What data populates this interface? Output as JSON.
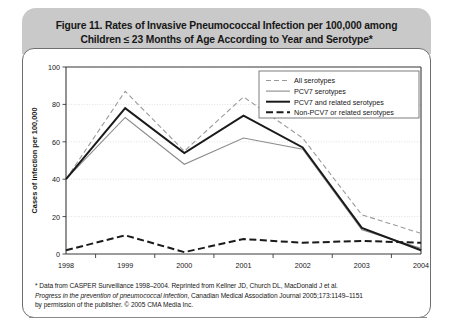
{
  "figure": {
    "title_line1": "Figure 11. Rates of Invasive Pneumococcal Infection per 100,000 among",
    "title_line2": "Children ≤ 23 Months of Age According to Year and Serotype*"
  },
  "footnote": {
    "line1": "* Data from CASPER Surveillance 1998–2004. Reprinted from Kellner JD, Church DL, MacDonald J et al.",
    "line2_italic": "Progress in the prevention of pneumococcal infection",
    "line2_rest": ", Canadian Medical Association Journal 2005;173:1149–1151",
    "line3": "by permission of the publisher. © 2005 CMA Media Inc."
  },
  "colors": {
    "header_band": "#c9c9c9",
    "panel_border": "#6f6f6f",
    "grid": "#d8d8d8",
    "axis": "#3a3a3a",
    "all_serotypes": "#9a9a9a",
    "pcv7_serotypes": "#8c8c8c",
    "pcv7_and_related": "#1a1a1a",
    "non_pcv7": "#1a1a1a"
  },
  "chart_data": {
    "type": "line",
    "title": "Rates of Invasive Pneumococcal Infection per 100,000 among Children ≤ 23 Months of Age According to Year and Serotype",
    "xlabel": "",
    "ylabel": "Cases of infection per 100,000",
    "categories": [
      "1998",
      "1999",
      "2000",
      "2001",
      "2002",
      "2003",
      "2004"
    ],
    "x_tick_labels": [
      "1998",
      "1999",
      "2000",
      "2001",
      "2002",
      "2003",
      "2004"
    ],
    "y_tick_labels": [
      "0",
      "20",
      "40",
      "60",
      "80",
      "100"
    ],
    "y_ticks": [
      0,
      20,
      40,
      60,
      80,
      100
    ],
    "ylim": [
      0,
      100
    ],
    "grid": true,
    "legend_position": "top-right",
    "series": [
      {
        "name": "All serotypes",
        "style": "dashed",
        "width": "thin",
        "color": "#9a9a9a",
        "values": [
          40,
          87,
          55,
          84,
          62,
          21,
          11
        ]
      },
      {
        "name": "PCV7 serotypes",
        "style": "solid",
        "width": "thin",
        "color": "#8c8c8c",
        "values": [
          40,
          73,
          48,
          62,
          56,
          13,
          3
        ]
      },
      {
        "name": "PCV7 and related serotypes",
        "style": "solid",
        "width": "thick",
        "color": "#1a1a1a",
        "values": [
          40,
          78,
          54,
          74,
          57,
          14,
          2
        ]
      },
      {
        "name": "Non-PCV7 or related serotypes",
        "style": "dashed",
        "width": "thick",
        "color": "#1a1a1a",
        "values": [
          2,
          10,
          1,
          8,
          6,
          7,
          6
        ]
      }
    ]
  },
  "legend": {
    "items": [
      {
        "label": "All serotypes"
      },
      {
        "label": "PCV7 serotypes"
      },
      {
        "label": "PCV7 and related serotypes"
      },
      {
        "label": "Non-PCV7 or related serotypes"
      }
    ]
  }
}
